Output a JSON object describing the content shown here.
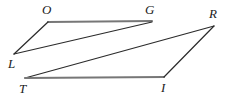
{
  "figure": {
    "kind": "geometry-diagram",
    "background_color": "#ffffff",
    "stroke_color": "#2b2b2b",
    "accent_stroke_color": "#6e6e6e",
    "vertices": [
      {
        "id": "O",
        "label": "O",
        "x": 48,
        "y": 22,
        "label_x": 42,
        "label_y": 3
      },
      {
        "id": "G",
        "label": "G",
        "x": 152,
        "y": 21,
        "label_x": 145,
        "label_y": 3
      },
      {
        "id": "R",
        "label": "R",
        "x": 214,
        "y": 26,
        "label_x": 209,
        "label_y": 7
      },
      {
        "id": "L",
        "label": "L",
        "x": 14,
        "y": 54,
        "label_x": 8,
        "label_y": 57
      },
      {
        "id": "T",
        "label": "T",
        "x": 25,
        "y": 78,
        "label_x": 19,
        "label_y": 82
      },
      {
        "id": "I",
        "label": "I",
        "x": 164,
        "y": 77,
        "label_x": 161,
        "label_y": 81
      }
    ],
    "edges": [
      {
        "id": "OG",
        "from": "O",
        "to": "G",
        "x1": 48,
        "y1": 22,
        "x2": 152,
        "y2": 21,
        "color": "#777777",
        "width": 2.0
      },
      {
        "id": "OL",
        "from": "O",
        "to": "L",
        "x1": 48,
        "y1": 22,
        "x2": 14,
        "y2": 54,
        "color": "#2b2b2b",
        "width": 1.2
      },
      {
        "id": "LG",
        "from": "L",
        "to": "G",
        "x1": 14,
        "y1": 54,
        "x2": 152,
        "y2": 22,
        "color": "#2b2b2b",
        "width": 1.2
      },
      {
        "id": "TR",
        "from": "T",
        "to": "R",
        "x1": 25,
        "y1": 78,
        "x2": 214,
        "y2": 26,
        "color": "#2b2b2b",
        "width": 1.2
      },
      {
        "id": "TI",
        "from": "T",
        "to": "I",
        "x1": 25,
        "y1": 78,
        "x2": 164,
        "y2": 77,
        "color": "#777777",
        "width": 2.0
      },
      {
        "id": "RI",
        "from": "R",
        "to": "I",
        "x1": 214,
        "y1": 26,
        "x2": 164,
        "y2": 77,
        "color": "#2b2b2b",
        "width": 1.2
      }
    ]
  },
  "labels": {
    "O": "O",
    "G": "G",
    "R": "R",
    "L": "L",
    "T": "T",
    "I": "I"
  }
}
